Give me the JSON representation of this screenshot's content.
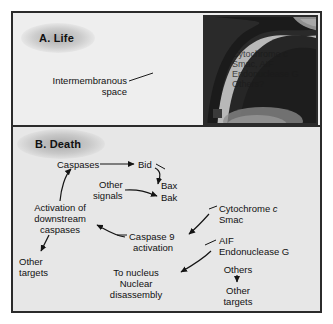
{
  "figure": {
    "panels": [
      {
        "id": "A",
        "label": "A. Life"
      },
      {
        "id": "B",
        "label": "B. Death"
      }
    ]
  },
  "panel_a": {
    "label": "A. Life",
    "annotations": [
      {
        "name": "intermembranous-space",
        "line1": "Intermembranous",
        "line2": "space"
      }
    ],
    "organelle": "mitochondrion"
  },
  "inset": {
    "name": "mitochondrion-micrograph-inset",
    "contents": [
      "Cytochrome c",
      "Smac, AIF",
      "Endonuclease G",
      "Others?"
    ]
  },
  "panel_b": {
    "label": "B. Death",
    "nodes": {
      "caspases": "Caspases",
      "bid": "Bid",
      "bax": "Bax",
      "bak": "Bak",
      "other_signals_l1": "Other",
      "other_signals_l2": "signals",
      "activation_l1": "Activation of",
      "activation_l2": "downstream",
      "activation_l3": "caspases",
      "other_targets_left_l1": "Other",
      "other_targets_left_l2": "targets",
      "cytochrome_c_pre": "Cytochrome ",
      "cytochrome_c_ital": "c",
      "smac": "Smac",
      "aif": "AIF",
      "endonuclease_g": "Endonuclease G",
      "caspase9_l1": "Caspase 9",
      "caspase9_l2": "activation",
      "to_nucleus_l1": "To nucleus",
      "to_nucleus_l2": "Nuclear",
      "to_nucleus_l3": "disassembly",
      "others": "Others",
      "other_targets_right_l1": "Other",
      "other_targets_right_l2": "targets"
    }
  },
  "colors": {
    "frame": "#2b2b2b",
    "panel_a_bg": "#eeeeee",
    "panel_b_bg": "#e7e7e7",
    "page_bg": "#ffffff",
    "membrane_dark": "#1e1e1e",
    "matrix_gray": "#9a9a9a",
    "text": "#111111"
  }
}
